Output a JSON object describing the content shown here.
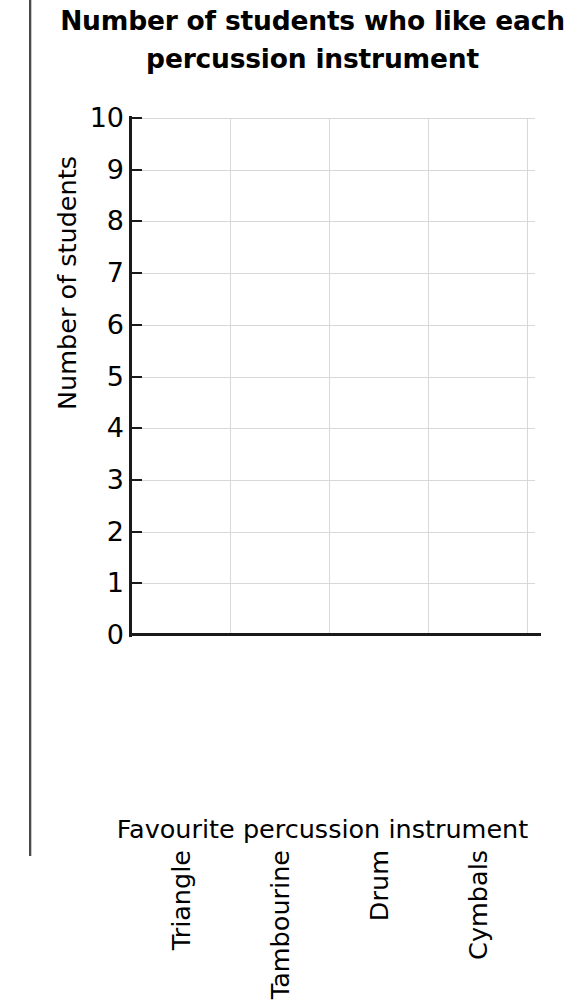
{
  "chart_data": {
    "type": "bar",
    "title": "Number of students who like each\npercussion instrument",
    "xlabel": "Favourite percussion instrument",
    "ylabel": "Number of students",
    "categories": [
      "Triangle",
      "Tambourine",
      "Drum",
      "Cymbals"
    ],
    "values": [
      0,
      0,
      0,
      0
    ],
    "ylim": [
      0,
      10
    ],
    "ytick_labels": [
      "10",
      "9",
      "8",
      "7",
      "6",
      "5",
      "4",
      "3",
      "2",
      "1",
      "0"
    ],
    "ytick_values": [
      10,
      9,
      8,
      7,
      6,
      5,
      4,
      3,
      2,
      1,
      0
    ],
    "grid": "horizontal-and-vertical",
    "legend": "none",
    "colors": {
      "text": "#000000",
      "axis": "#1a1a1a",
      "gridline": "#d8d8d8",
      "background": "#ffffff",
      "page_edge": "#4a4a4a"
    }
  }
}
